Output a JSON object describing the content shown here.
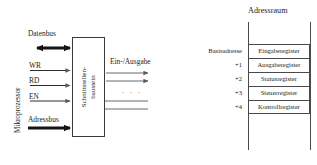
{
  "diagram": {
    "title_left": "",
    "processor_label": "Mikroprozessor",
    "chip_label_line1": "Schnittstellen-",
    "chip_label_line2": "baustein",
    "databus_label": "Datenbus",
    "addressbus_label": "Adressbus",
    "io_label": "Ein-/Ausgabe",
    "io_ellipsis": ". . .",
    "control_signals": [
      {
        "name": "WR"
      },
      {
        "name": "RD"
      },
      {
        "name": "EN"
      }
    ]
  },
  "address_space": {
    "title": "Adressraum",
    "base_label": "Basisadresse",
    "offsets": [
      "Basisadresse",
      "+1",
      "+2",
      "+3",
      "+4"
    ],
    "registers": [
      {
        "offset": "Basisadresse",
        "name": "Eingaberegister"
      },
      {
        "offset": "+1",
        "name": "Ausgaberegister"
      },
      {
        "offset": "+2",
        "name": "Statusregister"
      },
      {
        "offset": "+3",
        "name": "Steuerregister"
      },
      {
        "offset": "+4",
        "name": "Kontrollregister"
      }
    ]
  },
  "colors": {
    "ink": "#1d1d1d",
    "line": "#4a4a4a",
    "bus": "#141414",
    "thin": "#6b6b6b",
    "background": "#ffffff"
  }
}
